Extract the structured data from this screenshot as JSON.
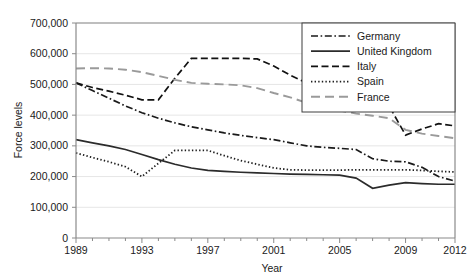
{
  "chart_data": {
    "type": "line",
    "title": "",
    "xlabel": "Year",
    "ylabel": "Force levels",
    "xlim": [
      1989,
      2012
    ],
    "ylim": [
      0,
      700000
    ],
    "ytick_labels": [
      "0",
      "100,000",
      "200,000",
      "300,000",
      "400,000",
      "500,000",
      "600,000",
      "700,000"
    ],
    "ytick_values": [
      0,
      100000,
      200000,
      300000,
      400000,
      500000,
      600000,
      700000
    ],
    "xtick_labels": [
      "1989",
      "1993",
      "1997",
      "2001",
      "2005",
      "2009",
      "2012"
    ],
    "xtick_values": [
      1989,
      1993,
      1997,
      2001,
      2005,
      2009,
      2012
    ],
    "grid": "horizontal",
    "legend_position": "top-right",
    "x": [
      1989,
      1990,
      1991,
      1992,
      1993,
      1994,
      1995,
      1996,
      1997,
      1998,
      1999,
      2000,
      2001,
      2002,
      2003,
      2004,
      2005,
      2006,
      2007,
      2008,
      2009,
      2010,
      2011,
      2012
    ],
    "series": [
      {
        "name": "Germany",
        "style": "dash-dot",
        "color": "#1a1a1a",
        "values": [
          505000,
          480000,
          455000,
          430000,
          408000,
          390000,
          375000,
          362000,
          352000,
          342000,
          334000,
          327000,
          320000,
          310000,
          300000,
          295000,
          292000,
          288000,
          258000,
          250000,
          248000,
          230000,
          200000,
          185000
        ]
      },
      {
        "name": "United Kingdom",
        "style": "solid",
        "color": "#2b2b2b",
        "values": [
          320000,
          310000,
          300000,
          288000,
          272000,
          255000,
          240000,
          228000,
          220000,
          217000,
          214000,
          212000,
          210000,
          208000,
          207000,
          206000,
          205000,
          195000,
          162000,
          172000,
          180000,
          177000,
          175000,
          175000
        ]
      },
      {
        "name": "Italy",
        "style": "dashed",
        "color": "#111111",
        "values": [
          505000,
          490000,
          478000,
          465000,
          450000,
          450000,
          520000,
          585000,
          585000,
          585000,
          585000,
          583000,
          560000,
          530000,
          505000,
          485000,
          470000,
          462000,
          458000,
          430000,
          335000,
          355000,
          372000,
          365000
        ]
      },
      {
        "name": "Spain",
        "style": "dotted",
        "color": "#1f1f1f",
        "values": [
          277000,
          262000,
          248000,
          232000,
          200000,
          243000,
          285000,
          285000,
          285000,
          268000,
          252000,
          240000,
          228000,
          222000,
          221000,
          221000,
          221000,
          222000,
          222000,
          222000,
          222000,
          220000,
          217000,
          215000
        ]
      },
      {
        "name": "France",
        "style": "long-dash",
        "color": "#9a9a9a",
        "values": [
          552000,
          553000,
          552000,
          548000,
          540000,
          528000,
          515000,
          505000,
          502000,
          500000,
          497000,
          488000,
          472000,
          458000,
          440000,
          425000,
          415000,
          405000,
          398000,
          390000,
          352000,
          340000,
          332000,
          325000
        ]
      }
    ]
  },
  "legend": {
    "items": [
      {
        "label": "Germany"
      },
      {
        "label": "United Kingdom"
      },
      {
        "label": "Italy"
      },
      {
        "label": "Spain"
      },
      {
        "label": "France"
      }
    ]
  }
}
